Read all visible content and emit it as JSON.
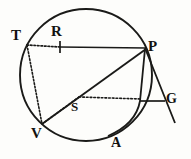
{
  "figure": {
    "background_color": "#fdfdfb",
    "ink_color": "#1a1a18",
    "labels": {
      "T": "T",
      "R": "R",
      "P": "P",
      "G": "G",
      "S": "S",
      "V": "V",
      "A": "A"
    },
    "geometry": {
      "circle": {
        "cx": 86,
        "cy": 75,
        "r": 66
      },
      "points": {
        "T": {
          "x": 26,
          "y": 46
        },
        "R": {
          "x": 60,
          "y": 47
        },
        "P": {
          "x": 146,
          "y": 48
        },
        "G": {
          "x": 163,
          "y": 101
        },
        "S": {
          "x": 79,
          "y": 100
        },
        "V": {
          "x": 42,
          "y": 124
        },
        "A": {
          "x": 116,
          "y": 140
        }
      },
      "solid_segments": [
        {
          "name": "chord-RP",
          "from": "R",
          "to": "P"
        },
        {
          "name": "chord-PV",
          "from": "P",
          "to": "V"
        },
        {
          "name": "tangent-PG-extended",
          "from": "P",
          "to": "G"
        },
        {
          "name": "secant-PA-arc",
          "from": "P",
          "to": "A"
        },
        {
          "name": "segment-to-G",
          "from": "S-right",
          "to": "G"
        }
      ],
      "dotted_segments": [
        {
          "name": "dotted-TR",
          "from": "T",
          "to": "R"
        },
        {
          "name": "dotted-TV",
          "from": "T",
          "to": "V"
        },
        {
          "name": "dotted-VS-right",
          "from": "V",
          "to": "right-edge"
        }
      ],
      "tick_marks": [
        {
          "name": "tick-at-R",
          "x": 60,
          "y": 47
        }
      ]
    }
  }
}
